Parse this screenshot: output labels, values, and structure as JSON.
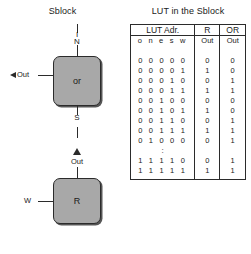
{
  "sblock": {
    "title": "Sblock",
    "or_block": {
      "label": "or",
      "input_top_line1": "I",
      "input_top_line2": "N",
      "output_left": "Out",
      "output_bottom": "S"
    },
    "r_block": {
      "label": "R",
      "output_top": "Out",
      "input_left": "W"
    }
  },
  "lut": {
    "title": "LUT in the Sblock",
    "headers": [
      "LUT Adr.",
      "R",
      "OR"
    ],
    "subheaders": [
      "o n e s w",
      "Out",
      "Out"
    ],
    "rows": [
      {
        "addr": "0 0 0 0 0",
        "r": "0",
        "or": "0"
      },
      {
        "addr": "0 0 0 0 1",
        "r": "1",
        "or": "0"
      },
      {
        "addr": "0 0 0 1 0",
        "r": "0",
        "or": "1"
      },
      {
        "addr": "0 0 0 1 1",
        "r": "1",
        "or": "1"
      },
      {
        "addr": "0 0 1 0 0",
        "r": "0",
        "or": "0"
      },
      {
        "addr": "0 0 1 0 1",
        "r": "1",
        "or": "0"
      },
      {
        "addr": "0 0 1 1 0",
        "r": "0",
        "or": "1"
      },
      {
        "addr": "0 0 1 1 1",
        "r": "1",
        "or": "1"
      },
      {
        "addr": "0 1 0 0 0",
        "r": "0",
        "or": "1"
      }
    ],
    "ellipsis": ":",
    "tail_rows": [
      {
        "addr": "1 1 1 1 0",
        "r": "0",
        "or": "1"
      },
      {
        "addr": "1 1 1 1 1",
        "r": "1",
        "or": "1"
      }
    ]
  },
  "colors": {
    "block_fill": "#a8a8a8",
    "line": "#2b2b2b",
    "background": "#ffffff"
  }
}
